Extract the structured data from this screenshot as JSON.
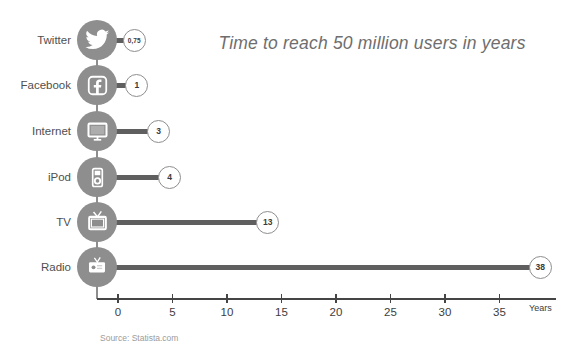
{
  "title": "Time to reach 50 million users in years",
  "chart_data": {
    "type": "bar",
    "orientation": "horizontal",
    "title": "Time to reach 50 million users in years",
    "categories": [
      "Twitter",
      "Facebook",
      "Internet",
      "iPod",
      "TV",
      "Radio"
    ],
    "values": [
      0.75,
      1,
      3,
      4,
      13,
      38
    ],
    "value_labels": [
      "0,75",
      "1",
      "3",
      "4",
      "13",
      "38"
    ],
    "icons": [
      "twitter-icon",
      "facebook-icon",
      "internet-icon",
      "ipod-icon",
      "tv-icon",
      "radio-icon"
    ],
    "xlabel": "Years",
    "xlim": [
      0,
      40
    ],
    "xticks": [
      0,
      5,
      10,
      15,
      20,
      25,
      30,
      35
    ],
    "xtick_labels": [
      "0",
      "5",
      "10",
      "15",
      "20",
      "25",
      "30",
      "35"
    ],
    "grid": false,
    "legend": false,
    "source": "Source: Statista.com",
    "colors": {
      "icon_circle": "#8e8e8e",
      "bar": "#5f5f5f",
      "value_circle_border": "#8e8e8e",
      "value_text": "#3a3a3a",
      "category_label": "#4f4f4f",
      "title": "#6e6e6e",
      "axis": "#454545",
      "source": "#9b9b9b"
    }
  }
}
